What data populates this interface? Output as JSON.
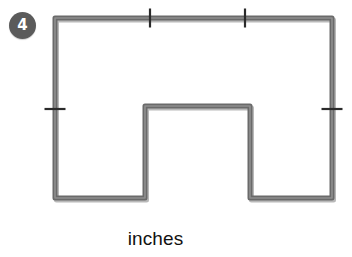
{
  "worksheet": {
    "problem_number": "4",
    "unit_label": "inches",
    "colors": {
      "badge_fill": "#5b5b5b",
      "badge_text": "#ffffff",
      "outline_stroke": "#6a6a6a",
      "outline_highlight": "#9a9a9a",
      "tick_stroke": "#2b2b2b",
      "label_text": "#111111",
      "background": "#ffffff"
    }
  },
  "figure": {
    "type": "polygon",
    "name": "u-shaped-hexagon",
    "stroke_width": 5,
    "vertices": [
      {
        "id": "top-left",
        "x": 55,
        "y": 18
      },
      {
        "id": "top-right",
        "x": 332,
        "y": 18
      },
      {
        "id": "bottom-right",
        "x": 332,
        "y": 198
      },
      {
        "id": "notch-right-bottom",
        "x": 250,
        "y": 198
      },
      {
        "id": "notch-right-top",
        "x": 250,
        "y": 106
      },
      {
        "id": "notch-left-top",
        "x": 145,
        "y": 106
      },
      {
        "id": "notch-left-bottom",
        "x": 145,
        "y": 198
      },
      {
        "id": "bottom-left",
        "x": 55,
        "y": 198
      }
    ],
    "tick_marks": [
      {
        "id": "tick-top-1",
        "orientation": "vertical",
        "x": 150,
        "y": 18,
        "length": 19
      },
      {
        "id": "tick-top-2",
        "orientation": "vertical",
        "x": 245,
        "y": 18,
        "length": 19
      },
      {
        "id": "tick-left",
        "orientation": "horizontal",
        "x": 55,
        "y": 109,
        "length": 21
      },
      {
        "id": "tick-right",
        "orientation": "horizontal",
        "x": 332,
        "y": 109,
        "length": 21
      }
    ]
  }
}
